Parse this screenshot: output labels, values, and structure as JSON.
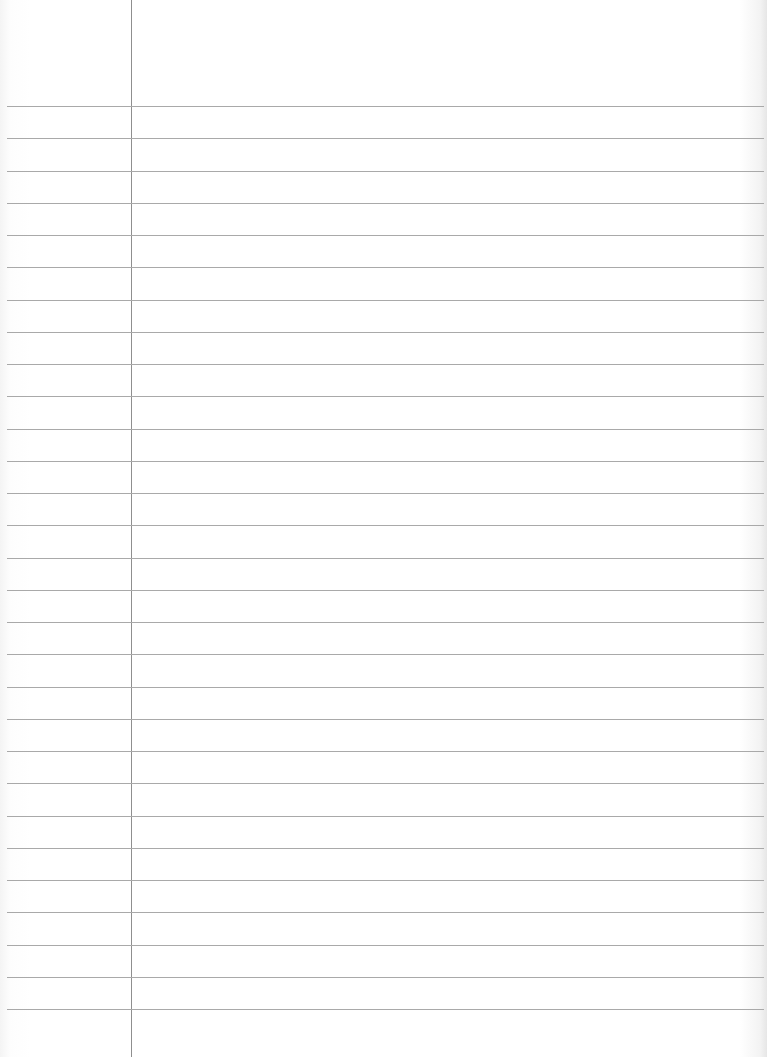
{
  "sheet": {
    "type": "lined-paper",
    "width": 767,
    "height": 1057,
    "background_color": "#ffffff",
    "rule_color": "#a9a9a9",
    "margin_color": "#8f8f8f",
    "margin_x": 131,
    "first_rule_y": 106,
    "rule_spacing": 32.25,
    "rule_count": 29,
    "rule_left": 7,
    "rule_right": 764
  }
}
